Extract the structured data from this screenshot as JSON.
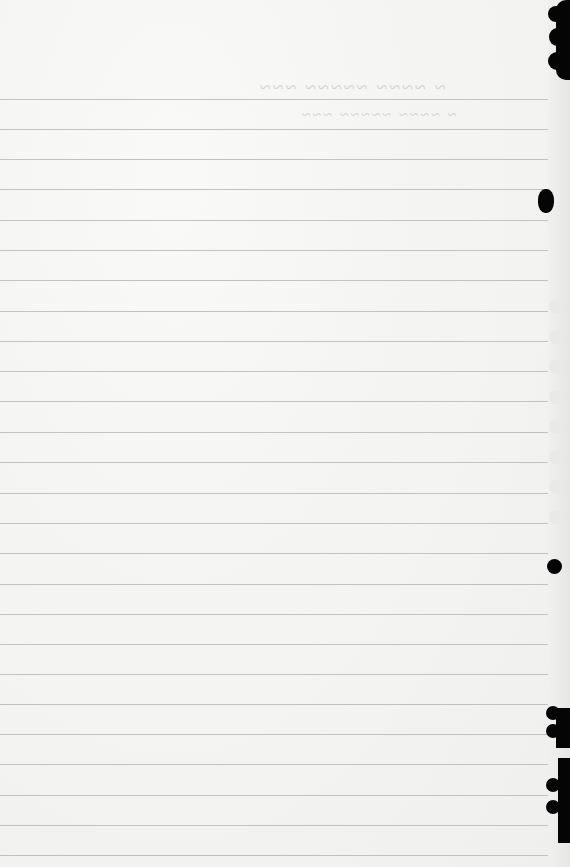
{
  "document": {
    "type": "lined notebook page (scanned, blank)",
    "bleed_through_text": {
      "line1": "illegible mirrored handwriting",
      "line2": "illegible mirrored handwriting"
    },
    "rule_lines_y": [
      99,
      129,
      159,
      189,
      220,
      250,
      280,
      311,
      341,
      371,
      401,
      432,
      462,
      493,
      523,
      553,
      584,
      614,
      644,
      674,
      704,
      734,
      764,
      795,
      825,
      855
    ],
    "colors": {
      "paper": "#f6f6f5",
      "rule": "#b9b9b9",
      "binding_holes": "#050505"
    }
  }
}
